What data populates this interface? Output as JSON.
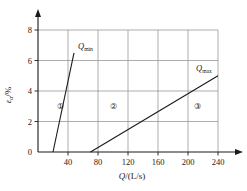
{
  "chart_data": {
    "type": "line",
    "title": "",
    "xlabel": "Q/(L/s)",
    "ylabel": "εa/%",
    "ylabel_symbol": "ε",
    "ylabel_subscript": "a",
    "ylabel_unit": "/%",
    "xlabel_symbol": "Q",
    "xlabel_unit": "/(L/s)",
    "xlim": [
      0,
      240
    ],
    "ylim": [
      0,
      8
    ],
    "xticks": [
      40,
      80,
      120,
      160,
      200,
      240
    ],
    "xtick_labels": [
      "40",
      "80",
      "120",
      "160",
      "200",
      "240"
    ],
    "yticks": [
      0,
      2,
      4,
      6,
      8
    ],
    "ytick_labels": [
      "0",
      "2",
      "4",
      "6",
      "8"
    ],
    "grid": true,
    "legend": "none",
    "series": [
      {
        "name": "Qmin",
        "label": "Q",
        "label_subscript": "min",
        "x": [
          20,
          48
        ],
        "y": [
          0,
          6.5
        ]
      },
      {
        "name": "Qmax",
        "label": "Q",
        "label_subscript": "max",
        "x": [
          70,
          240
        ],
        "y": [
          0,
          5
        ]
      }
    ],
    "annotations": [
      {
        "text": "①",
        "x": 30,
        "y": 3,
        "name": "region-1"
      },
      {
        "text": "②",
        "x": 100,
        "y": 3,
        "name": "region-2"
      },
      {
        "text": "③",
        "x": 213,
        "y": 3,
        "name": "region-3"
      }
    ],
    "colors": {
      "axis": "#1a1a1a",
      "grid": "#8a8a8a",
      "line": "#1a1a1a",
      "background": "#ffffff"
    }
  }
}
